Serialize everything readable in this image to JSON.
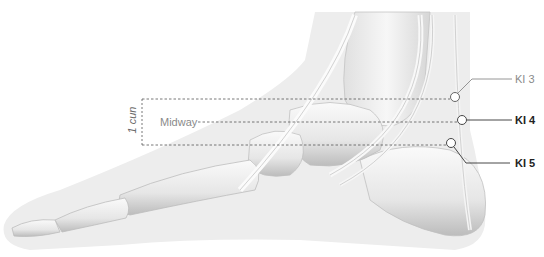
{
  "figure": {
    "measure_label": "1 cun",
    "midway_label": "Midway"
  },
  "points": [
    {
      "id": "KI3",
      "label": "KI 3",
      "style": "light",
      "cx": 455,
      "cy": 97
    },
    {
      "id": "KI4",
      "label": "KI 4",
      "style": "bold",
      "cx": 462,
      "cy": 120
    },
    {
      "id": "KI5",
      "label": "KI 5",
      "style": "bold",
      "cx": 451,
      "cy": 143
    }
  ],
  "colors": {
    "silhouette": "#ececec",
    "bone": "#f4f4f4",
    "bone_shadow": "#bdbdbd",
    "leader_light": "#8a8a8a",
    "leader_dark": "#333333",
    "dashed": "#555555"
  }
}
